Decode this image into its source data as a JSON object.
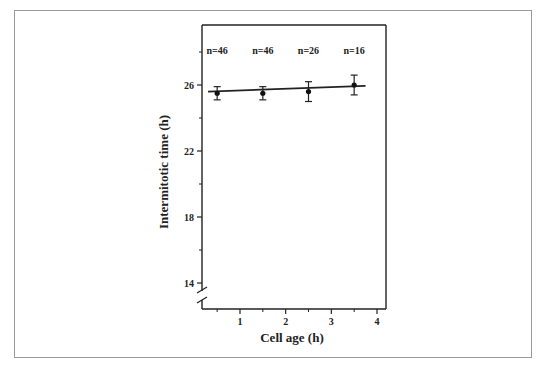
{
  "chart_data": {
    "type": "scatter",
    "title": "",
    "xlabel": "Cell  age  (h)",
    "ylabel": "Intermitotic time (h)",
    "xlim": [
      0.1,
      4.2
    ],
    "ylim": [
      13.5,
      29.5
    ],
    "x_ticks": [
      1,
      2,
      3,
      4
    ],
    "x_minor_ticks": [
      0.5,
      1.5,
      2.5,
      3.5
    ],
    "y_ticks": [
      14,
      18,
      22,
      26
    ],
    "y_minor_ticks": [
      16,
      20,
      24,
      28
    ],
    "axis_break": "y",
    "grid": false,
    "series": [
      {
        "name": "Intermitotic time",
        "x": [
          0.5,
          1.5,
          2.5,
          3.5
        ],
        "y": [
          25.5,
          25.5,
          25.6,
          26.0
        ],
        "error": [
          0.4,
          0.4,
          0.6,
          0.6
        ],
        "n_labels": [
          "n=46",
          "n=46",
          "n=26",
          "n=16"
        ]
      }
    ],
    "fit_line": {
      "x": [
        0.3,
        3.75
      ],
      "y": [
        25.6,
        25.95
      ]
    }
  }
}
